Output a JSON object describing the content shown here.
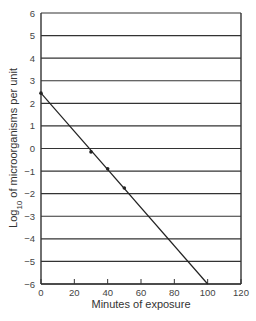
{
  "chart_data": {
    "type": "line",
    "title": "",
    "xlabel": "Minutes of exposure",
    "ylabel": "Log10 of microorganisms per unit",
    "ylabel_parts": {
      "pre": "Log",
      "sub": "10",
      "post": " of microorganisms per unit"
    },
    "xlim": [
      0,
      120
    ],
    "ylim": [
      -6,
      6
    ],
    "xticks": [
      0,
      20,
      40,
      60,
      80,
      100,
      120
    ],
    "yticks": [
      6,
      5,
      4,
      3,
      2,
      1,
      0,
      -1,
      -2,
      -3,
      -4,
      -5,
      -6
    ],
    "ytick_labels": [
      "6",
      "5",
      "4",
      "3",
      "2",
      "1",
      "0",
      "−1",
      "−2",
      "−3",
      "−4",
      "−5",
      "−6"
    ],
    "grid": {
      "horizontal": true,
      "vertical": false
    },
    "series": [
      {
        "name": "Survival curve (fitted line)",
        "x": [
          0,
          100
        ],
        "y": [
          2.45,
          -6
        ]
      },
      {
        "name": "Observed points",
        "x": [
          0,
          30,
          40,
          50
        ],
        "y": [
          2.45,
          -0.15,
          -0.9,
          -1.75
        ]
      }
    ],
    "colors": {
      "line": "#222222",
      "grid": "#333333",
      "axis": "#333333"
    }
  }
}
